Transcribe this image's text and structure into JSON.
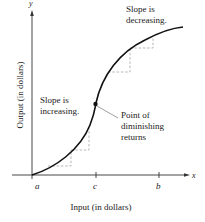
{
  "figure": {
    "axes": {
      "x_axis_var": "x",
      "y_axis_var": "y",
      "x_label": "Input (in dollars)",
      "y_label": "Output (in dollars)",
      "ticks": [
        {
          "label": "a"
        },
        {
          "label": "c"
        },
        {
          "label": "b"
        }
      ]
    },
    "annotations": {
      "decreasing_line1": "Slope is",
      "decreasing_line2": "decreasing.",
      "increasing_line1": "Slope is",
      "increasing_line2": "increasing.",
      "point_line1": "Point of",
      "point_line2": "diminishing",
      "point_line3": "returns"
    },
    "colors": {
      "curve": "#111111",
      "axis": "#333333",
      "dashed": "#9a9a9a"
    }
  }
}
